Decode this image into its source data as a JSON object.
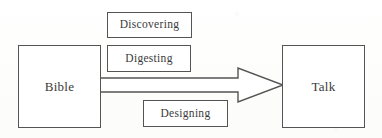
{
  "diagram": {
    "background_color": "#fefefe",
    "stroke_color": "#545454",
    "text_color": "#3a3a3a",
    "nodes": {
      "source": {
        "label": "Bible"
      },
      "target": {
        "label": "Talk"
      },
      "steps": [
        {
          "label": "Discovering"
        },
        {
          "label": "Digesting"
        },
        {
          "label": "Designing"
        }
      ]
    },
    "connector": {
      "kind": "block-arrow",
      "direction": "left-to-right",
      "filled": false
    }
  }
}
